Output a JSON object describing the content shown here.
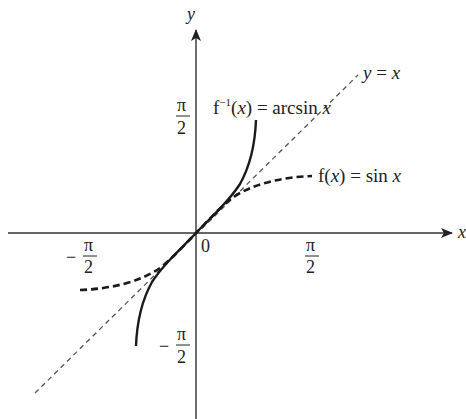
{
  "diagram": {
    "axes": {
      "x_label": "x",
      "y_label": "y",
      "origin_label": "0"
    },
    "ticks": {
      "x_neg": {
        "sign": "−",
        "num": "π",
        "den": "2"
      },
      "x_pos": {
        "num": "π",
        "den": "2"
      },
      "y_pos": {
        "num": "π",
        "den": "2"
      },
      "y_neg": {
        "sign": "−",
        "num": "π",
        "den": "2"
      }
    },
    "curves": {
      "identity": {
        "lhs": "y",
        "eq": " = ",
        "rhs": "x",
        "style": "thin dashed"
      },
      "sin": {
        "f": "f(",
        "var": "x",
        "close": ")",
        "eq": " = sin ",
        "arg": "x",
        "style": "thick dashed"
      },
      "arcsin": {
        "f": "f",
        "sup": "−1",
        "open": "(",
        "var": "x",
        "close": ")",
        "eq": " = arcsin ",
        "arg": "x",
        "style": "solid"
      }
    },
    "colors": {
      "axis": "#333333",
      "curve": "#1a1a1a",
      "identity_line": "#555555"
    }
  }
}
